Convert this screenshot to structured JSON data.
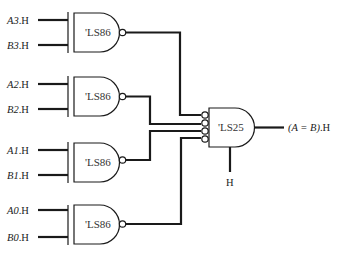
{
  "diagram": {
    "xor_gates": [
      {
        "part": "'LS86",
        "input_a": {
          "name": "A3",
          "suffix": ".H"
        },
        "input_b": {
          "name": "B3",
          "suffix": ".H"
        }
      },
      {
        "part": "'LS86",
        "input_a": {
          "name": "A2",
          "suffix": ".H"
        },
        "input_b": {
          "name": "B2",
          "suffix": ".H"
        }
      },
      {
        "part": "'LS86",
        "input_a": {
          "name": "A1",
          "suffix": ".H"
        },
        "input_b": {
          "name": "B1",
          "suffix": ".H"
        }
      },
      {
        "part": "'LS86",
        "input_a": {
          "name": "A0",
          "suffix": ".H"
        },
        "input_b": {
          "name": "B0",
          "suffix": ".H"
        }
      }
    ],
    "output_gate": {
      "part": "'LS25",
      "enable_label": "H",
      "output_label": "(A = B)",
      "output_suffix": ".H"
    }
  }
}
